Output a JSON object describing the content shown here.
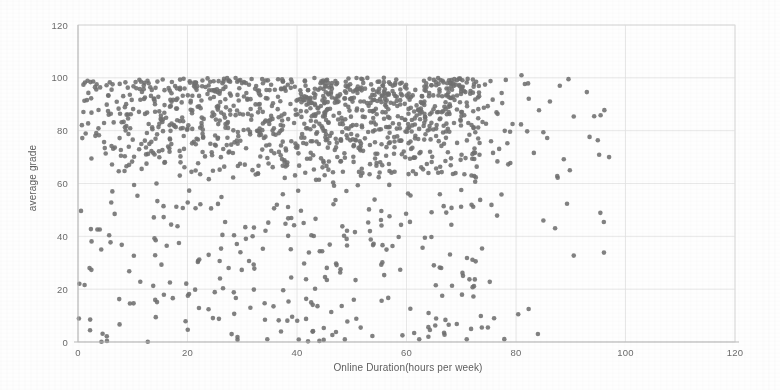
{
  "chart_data": {
    "type": "scatter",
    "title": "",
    "xlabel": "Online Duration(hours per week)",
    "ylabel": "average grade",
    "xlim": [
      0,
      120
    ],
    "ylim": [
      0,
      120
    ],
    "xticks": [
      0,
      20,
      40,
      60,
      80,
      100,
      120
    ],
    "yticks": [
      0,
      20,
      40,
      60,
      80,
      100,
      120
    ],
    "xtick_labels": [
      "0",
      "20",
      "40",
      "60",
      "80",
      "100",
      "120"
    ],
    "ytick_labels": [
      "0",
      "20",
      "40",
      "60",
      "80",
      "100",
      "120"
    ],
    "grid": true,
    "legend": "none",
    "marker_color": "#6f6f6f",
    "marker_size": 4.6,
    "background_color": "#fefefe",
    "gridline_color": "#e2e2e2",
    "axis_color": "#b9b9b9",
    "n_points": 1400,
    "clusters": [
      {
        "name": "main-high-grade-band",
        "x_range": [
          0,
          72
        ],
        "y_range": [
          58,
          100
        ],
        "count": 1080,
        "note": "dense saturated band, densest between x 20-60"
      },
      {
        "name": "low-grade-scatter",
        "x_range": [
          0,
          75
        ],
        "y_range": [
          0,
          58
        ],
        "count": 250,
        "note": "sparse uniform scatter"
      },
      {
        "name": "right-tail",
        "x_range": [
          72,
          97
        ],
        "y_range": [
          0,
          101
        ],
        "count": 70,
        "note": "thin tail of outliers, mostly high grade"
      }
    ],
    "notable_points": [
      {
        "x": 97,
        "y": 70
      },
      {
        "x": 88,
        "y": 97
      },
      {
        "x": 85,
        "y": 46
      },
      {
        "x": 84,
        "y": 3
      },
      {
        "x": 81,
        "y": 101
      },
      {
        "x": 76,
        "y": 9
      },
      {
        "x": 71,
        "y": 1
      },
      {
        "x": 64,
        "y": 2
      }
    ]
  },
  "geometry": {
    "plot_left": 78,
    "plot_right": 735,
    "plot_top": 25,
    "plot_bottom": 342,
    "xaxis_title_x": 408,
    "xaxis_title_y": 371,
    "yaxis_title_x": 36,
    "yaxis_title_y": 178
  }
}
